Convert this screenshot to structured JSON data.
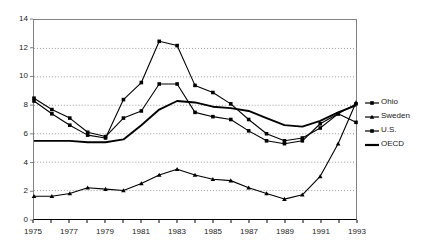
{
  "chart_data": {
    "type": "line",
    "title": "",
    "xlabel": "",
    "ylabel": "",
    "xlim": [
      1975,
      1993
    ],
    "ylim": [
      0,
      14
    ],
    "ytick_labels": [
      "0",
      "2",
      "4",
      "6",
      "8",
      "10",
      "12",
      "14"
    ],
    "ytick_values": [
      0,
      2,
      4,
      6,
      8,
      10,
      12,
      14
    ],
    "xtick_labels": [
      "1975",
      "1977",
      "1979",
      "1981",
      "1983",
      "1985",
      "1987",
      "1989",
      "1991",
      "1993"
    ],
    "xtick_values": [
      1975,
      1977,
      1979,
      1981,
      1983,
      1985,
      1987,
      1989,
      1991,
      1993
    ],
    "grid": "horizontal-dotted",
    "legend_position": "right",
    "x": [
      1975,
      1976,
      1977,
      1978,
      1979,
      1980,
      1981,
      1982,
      1983,
      1984,
      1985,
      1986,
      1987,
      1988,
      1989,
      1990,
      1991,
      1992,
      1993
    ],
    "series": [
      {
        "name": "Ohio",
        "marker": "square",
        "values": [
          8.3,
          7.4,
          6.6,
          5.9,
          5.7,
          8.4,
          9.6,
          12.5,
          12.2,
          9.4,
          8.9,
          8.1,
          7.0,
          6.0,
          5.5,
          5.7,
          6.4,
          7.4,
          8.1
        ]
      },
      {
        "name": "Sweden",
        "marker": "triangle",
        "values": [
          1.6,
          1.6,
          1.8,
          2.2,
          2.1,
          2.0,
          2.5,
          3.1,
          3.5,
          3.1,
          2.8,
          2.7,
          2.2,
          1.8,
          1.4,
          1.7,
          3.0,
          5.3,
          8.2
        ]
      },
      {
        "name": "U.S.",
        "marker": "square",
        "values": [
          8.5,
          7.7,
          7.1,
          6.1,
          5.8,
          7.1,
          7.6,
          9.5,
          9.5,
          7.5,
          7.2,
          7.0,
          6.2,
          5.5,
          5.3,
          5.5,
          6.7,
          7.4,
          6.8
        ]
      },
      {
        "name": "OECD",
        "marker": "none",
        "values": [
          5.5,
          5.5,
          5.5,
          5.4,
          5.4,
          5.6,
          6.6,
          7.7,
          8.3,
          8.2,
          7.9,
          7.8,
          7.6,
          7.1,
          6.6,
          6.5,
          6.9,
          7.5,
          8.0
        ]
      }
    ]
  },
  "legend": {
    "items": [
      {
        "label": "Ohio",
        "key": "square-marker-line"
      },
      {
        "label": "Sweden",
        "key": "triangle-marker-line"
      },
      {
        "label": "U.S.",
        "key": "square-marker-line"
      },
      {
        "label": "OECD",
        "key": "plain-thick-line"
      }
    ]
  },
  "colors": {
    "series": "#000000",
    "axis": "#808080",
    "grid": "#999999",
    "text": "#1a1a1a",
    "background": "#ffffff"
  }
}
